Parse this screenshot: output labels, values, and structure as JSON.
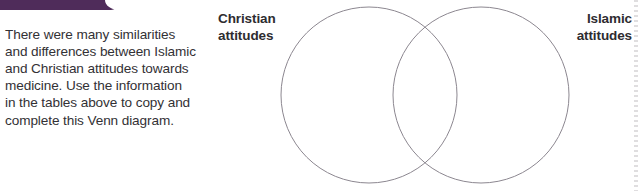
{
  "page": {
    "background_color": "#ffffff",
    "accent_color": "#4f2c5a",
    "text_color": "#333135",
    "stroke_color": "#8c8790"
  },
  "instruction": {
    "text": "There were many similarities\nand differences between Islamic\nand Christian attitudes towards\nmedicine. Use the information\nin the tables above to copy and\ncomplete this Venn diagram.",
    "lines": [
      "There were many similarities",
      "and differences between Islamic",
      "and Christian attitudes towards",
      "medicine. Use the information",
      "in the tables above to copy and",
      "complete this Venn diagram."
    ]
  },
  "venn": {
    "type": "venn-two-set",
    "left_label": {
      "line1": "Christian",
      "line2": "attitudes"
    },
    "right_label": {
      "line1": "Islamic",
      "line2": "attitudes"
    },
    "left_circle": {
      "cx": 369,
      "cy": 95,
      "r": 88
    },
    "right_circle": {
      "cx": 481,
      "cy": 95,
      "r": 88
    },
    "left_contents": [],
    "right_contents": [],
    "overlap_contents": []
  }
}
